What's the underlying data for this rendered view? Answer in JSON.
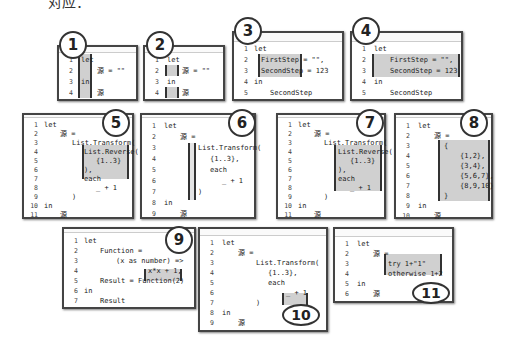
{
  "caption": "对应：",
  "panels": [
    {
      "id": "1",
      "badge": "1",
      "lines": [
        {
          "n": "1",
          "t": "let"
        },
        {
          "n": "2",
          "t": "源 = \"\""
        },
        {
          "n": "3",
          "t": "in"
        },
        {
          "n": "4",
          "t": "源"
        }
      ]
    },
    {
      "id": "2",
      "badge": "2",
      "lines": [
        {
          "n": "1",
          "t": "let"
        },
        {
          "n": "2",
          "t": "源 = \"\""
        },
        {
          "n": "3",
          "t": "in"
        },
        {
          "n": "4",
          "t": "源"
        }
      ]
    },
    {
      "id": "3",
      "badge": "3",
      "lines": [
        {
          "n": "1",
          "t": "let"
        },
        {
          "n": "2",
          "t": "FirstStep = \"\","
        },
        {
          "n": "3",
          "t": "SecondStep = 123"
        },
        {
          "n": "4",
          "t": "in"
        },
        {
          "n": "5",
          "t": "SecondStep"
        }
      ]
    },
    {
      "id": "4",
      "badge": "4",
      "lines": [
        {
          "n": "1",
          "t": "let"
        },
        {
          "n": "2",
          "t": "FirstStep = \"\","
        },
        {
          "n": "3",
          "t": "SecondStep = 123"
        },
        {
          "n": "4",
          "t": "in"
        },
        {
          "n": "5",
          "t": "SecondStep"
        }
      ]
    },
    {
      "id": "5",
      "badge": "5",
      "lines": [
        {
          "n": "1",
          "t": "let"
        },
        {
          "n": "2",
          "t": "源 ="
        },
        {
          "n": "3",
          "t": "List.Transform("
        },
        {
          "n": "4",
          "t": "List.Reverse("
        },
        {
          "n": "5",
          "t": "{1..3}"
        },
        {
          "n": "6",
          "t": "),"
        },
        {
          "n": "7",
          "t": "each"
        },
        {
          "n": "8",
          "t": "_ + 1"
        },
        {
          "n": "9",
          "t": ")"
        },
        {
          "n": "10",
          "t": "in"
        },
        {
          "n": "11",
          "t": "源"
        }
      ]
    },
    {
      "id": "6",
      "badge": "6",
      "lines": [
        {
          "n": "1",
          "t": "let"
        },
        {
          "n": "2",
          "t": "源 ="
        },
        {
          "n": "3",
          "t": "List.Transform("
        },
        {
          "n": "4",
          "t": "{1..3},"
        },
        {
          "n": "5",
          "t": "each"
        },
        {
          "n": "6",
          "t": "_ + 1"
        },
        {
          "n": "7",
          "t": ")"
        },
        {
          "n": "8",
          "t": "in"
        },
        {
          "n": "9",
          "t": "源"
        }
      ]
    },
    {
      "id": "7",
      "badge": "7",
      "lines": [
        {
          "n": "1",
          "t": "let"
        },
        {
          "n": "2",
          "t": "源 ="
        },
        {
          "n": "3",
          "t": "List.Transform("
        },
        {
          "n": "4",
          "t": "List.Reverse("
        },
        {
          "n": "5",
          "t": "{1..3}"
        },
        {
          "n": "6",
          "t": "),"
        },
        {
          "n": "7",
          "t": "each"
        },
        {
          "n": "8",
          "t": "_ + 1"
        },
        {
          "n": "9",
          "t": ")"
        },
        {
          "n": "10",
          "t": "in"
        },
        {
          "n": "11",
          "t": "源"
        }
      ]
    },
    {
      "id": "8",
      "badge": "8",
      "lines": [
        {
          "n": "1",
          "t": "let"
        },
        {
          "n": "2",
          "t": "源 ="
        },
        {
          "n": "3",
          "t": "{"
        },
        {
          "n": "4",
          "t": "{1,2},"
        },
        {
          "n": "5",
          "t": "{3,4},"
        },
        {
          "n": "6",
          "t": "{5,6,7},"
        },
        {
          "n": "7",
          "t": "{8,9,10}"
        },
        {
          "n": "8",
          "t": "}"
        },
        {
          "n": "9",
          "t": "in"
        },
        {
          "n": "10",
          "t": "源"
        }
      ]
    },
    {
      "id": "9",
      "badge": "9",
      "lines": [
        {
          "n": "1",
          "t": "let"
        },
        {
          "n": "2",
          "t": "Function ="
        },
        {
          "n": "3",
          "t": "(x as number) =>"
        },
        {
          "n": "4",
          "t": "x*x + 1,"
        },
        {
          "n": "5",
          "t": "Result = Function(2)"
        },
        {
          "n": "6",
          "t": "in"
        },
        {
          "n": "7",
          "t": "Result"
        }
      ]
    },
    {
      "id": "10",
      "badge": "10",
      "lines": [
        {
          "n": "1",
          "t": "let"
        },
        {
          "n": "2",
          "t": "源 ="
        },
        {
          "n": "3",
          "t": "List.Transform("
        },
        {
          "n": "4",
          "t": "{1..3},"
        },
        {
          "n": "5",
          "t": "each"
        },
        {
          "n": "6",
          "t": "_ + 1"
        },
        {
          "n": "7",
          "t": ")"
        },
        {
          "n": "8",
          "t": "in"
        },
        {
          "n": "9",
          "t": "源"
        }
      ]
    },
    {
      "id": "11",
      "badge": "11",
      "lines": [
        {
          "n": "1",
          "t": "let"
        },
        {
          "n": "2",
          "t": "源 ="
        },
        {
          "n": "3",
          "t": "try 1+\"1\""
        },
        {
          "n": "4",
          "t": "otherwise 1+2"
        },
        {
          "n": "5",
          "t": "in"
        },
        {
          "n": "6",
          "t": "源"
        }
      ]
    }
  ]
}
